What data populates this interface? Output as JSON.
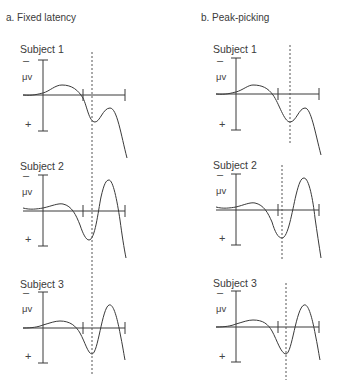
{
  "panels": [
    {
      "title": "a. Fixed latency",
      "subjects": [
        {
          "label": "Subject 1",
          "y_axis_neg": "–",
          "y_axis_unit": "μv",
          "y_axis_pos": "+"
        },
        {
          "label": "Subject 2",
          "y_axis_neg": "–",
          "y_axis_unit": "μv",
          "y_axis_pos": "+"
        },
        {
          "label": "Subject 3",
          "y_axis_neg": "–",
          "y_axis_unit": "μv",
          "y_axis_pos": "+"
        }
      ]
    },
    {
      "title": "b. Peak-picking",
      "subjects": [
        {
          "label": "Subject 1",
          "y_axis_neg": "–",
          "y_axis_unit": "μv",
          "y_axis_pos": "+"
        },
        {
          "label": "Subject 2",
          "y_axis_neg": "–",
          "y_axis_unit": "μv",
          "y_axis_pos": "+"
        },
        {
          "label": "Subject 3",
          "y_axis_neg": "–",
          "y_axis_unit": "μv",
          "y_axis_pos": "+"
        }
      ]
    }
  ],
  "colors": {
    "line": "#3a3a3a",
    "dotted": "#555555"
  }
}
